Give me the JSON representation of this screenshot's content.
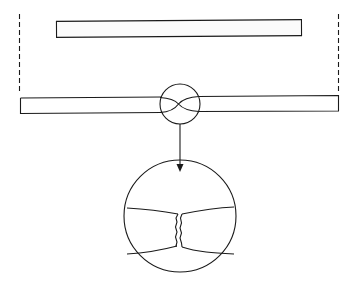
{
  "diagram": {
    "colors": {
      "stroke": "#1a1a1a",
      "background": "#ffffff",
      "fill": "#fbfbfb"
    },
    "elements": {
      "original_bar": {
        "x": 56,
        "y": 20,
        "w": 246,
        "h": 17
      },
      "left_limit_line": {
        "x": 19,
        "y1": 14,
        "y2": 93,
        "style": "dashed"
      },
      "right_limit_line": {
        "x": 339,
        "y1": 14,
        "y2": 93,
        "style": "dashed"
      },
      "stretched_bar": {
        "x": 20,
        "y": 96,
        "w": 319,
        "h": 17
      },
      "necking_circle": {
        "cx": 180,
        "cy": 104,
        "r": 20
      },
      "arrow": {
        "x": 180,
        "y1": 124,
        "y2": 171
      },
      "detail_circle": {
        "cx": 180,
        "cy": 216,
        "r": 56
      }
    }
  }
}
